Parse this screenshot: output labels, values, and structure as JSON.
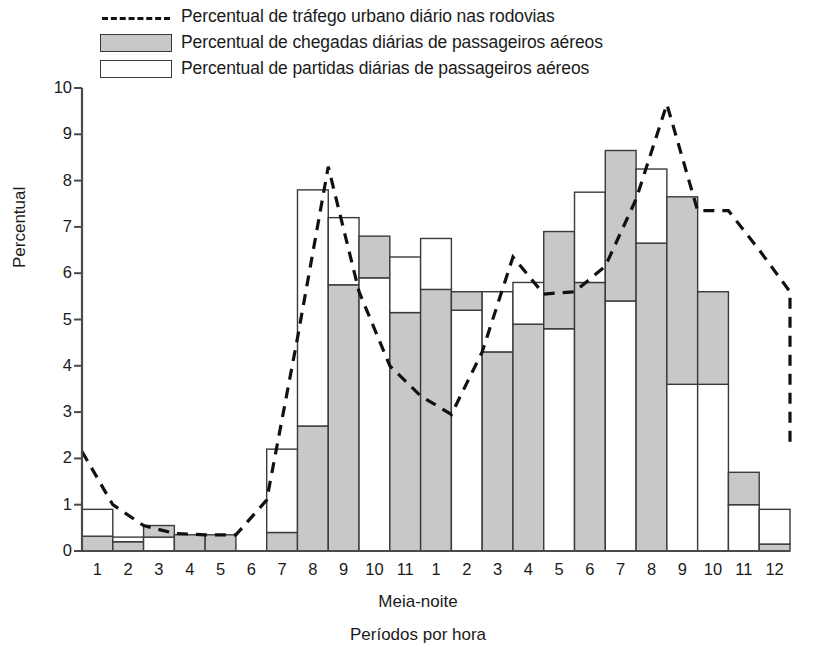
{
  "legend": {
    "items": [
      {
        "key": "dashed-line",
        "label": "Percentual de tráfego urbano diário nas rodovias"
      },
      {
        "key": "gray-swatch",
        "label": "Percentual de chegadas diárias de passageiros aéreos"
      },
      {
        "key": "white-swatch",
        "label": "Percentual de partidas diárias de passageiros aéreos"
      }
    ]
  },
  "axes": {
    "y_title": "Percentual",
    "x_title": "Períodos por hora",
    "x_midnight_note": "Meia-noite",
    "y_ticks": [
      "0",
      "1",
      "2",
      "3",
      "4",
      "5",
      "6",
      "7",
      "8",
      "9",
      "10"
    ],
    "ylim": [
      0,
      10
    ]
  },
  "colors": {
    "arrivals_fill": "#c8c8c8",
    "departures_fill": "#ffffff",
    "bar_stroke": "#3a3a3a",
    "line_color": "#111111",
    "axis_color": "#4a4a4a"
  },
  "chart_data": {
    "type": "bar",
    "title": "",
    "xlabel": "Períodos por hora",
    "ylabel": "Percentual",
    "ylim": [
      0,
      10
    ],
    "grid": false,
    "legend_position": "top",
    "stacked": true,
    "categories": [
      "1",
      "2",
      "3",
      "4",
      "5",
      "6",
      "7",
      "8",
      "9",
      "10",
      "11",
      "1",
      "2",
      "3",
      "4",
      "5",
      "6",
      "7",
      "8",
      "9",
      "10",
      "11",
      "12"
    ],
    "series": [
      {
        "name": "Percentual de chegadas diárias de passageiros aéreos",
        "style": "bar-gray",
        "values": [
          0.32,
          0.2,
          0.25,
          0.35,
          0.35,
          0.0,
          0.4,
          2.7,
          5.75,
          5.9,
          5.15,
          5.65,
          5.2,
          4.3,
          4.9,
          4.8,
          5.8,
          5.4,
          6.65,
          3.6,
          3.6,
          1.0,
          0.15
        ]
      },
      {
        "name": "Percentual de partidas diárias de passageiros aéreos",
        "style": "bar-white",
        "values": [
          0.58,
          0.1,
          0.3,
          0.0,
          0.0,
          0.0,
          1.8,
          5.1,
          1.45,
          0.9,
          1.2,
          1.1,
          0.4,
          1.3,
          0.9,
          2.1,
          1.95,
          3.25,
          1.6,
          4.05,
          2.0,
          0.7,
          0.75
        ]
      }
    ],
    "stack_order_note": [
      "1: gray 0-0.32 then white 0.32-0.90",
      "2: gray 0-0.20 then white 0.20-0.30",
      "3: white 0-0.30 then gray 0.30-0.55",
      "4: gray 0-0.35",
      "5: gray 0-0.35",
      "6: empty (~0)",
      "7: gray 0-0.40 then white 0.40-2.20",
      "8: gray 0-2.70 then white 2.70-7.80",
      "9: gray 0-5.75 then white 5.75-7.20",
      "10: white 0-5.90 then gray 5.90-6.80",
      "11: gray 0-5.15 then white 5.15-6.35",
      "12 (1 PM): gray 0-5.65 then white 5.65-6.75",
      "13 (2 PM): white 0-5.20 then gray 5.20-5.60",
      "14 (3 PM): gray 0-4.30 then white 4.30-5.60",
      "15 (4 PM): gray 0-4.90 then white 4.90-5.80",
      "16 (5 PM): white 0-4.80 then gray 4.80-6.90",
      "17 (6 PM): gray 0-5.80 then white 5.80-7.75",
      "18 (7 PM): white 0-5.40 then gray 5.40-8.65",
      "19 (8 PM): gray 0-6.65 then white 6.65-8.25",
      "20 (9 PM): white 0-3.60 then gray 3.60-7.65",
      "21 (10 PM): white 0-3.60 then gray 3.60-5.60",
      "22 (11 PM): white 0-1.00 then gray 1.00-1.70",
      "23 (12 AM): gray 0-0.15 then white 0.15-0.90"
    ],
    "line_series": {
      "name": "Percentual de tráfego urbano diário nas rodovias",
      "style": "dashed",
      "values": [
        2.15,
        1.0,
        0.55,
        0.38,
        0.35,
        0.35,
        1.1,
        4.6,
        8.3,
        5.6,
        4.0,
        3.35,
        2.95,
        4.3,
        6.35,
        5.55,
        5.6,
        6.15,
        7.6,
        9.65,
        7.35,
        7.35,
        6.5,
        5.6,
        5.25,
        3.9,
        3.0,
        2.3
      ]
    }
  },
  "plot": {
    "bar_count": 23,
    "x_left_px": 82,
    "x_right_px": 790,
    "y_zero_px": 551,
    "y_top_px": 88
  }
}
